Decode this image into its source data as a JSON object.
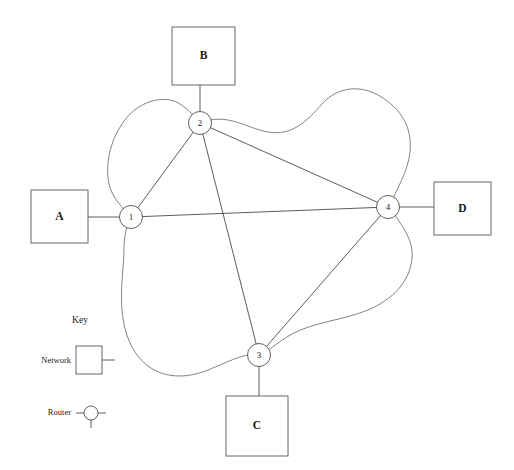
{
  "diagram": {
    "type": "network-topology",
    "title": "",
    "colors": {
      "background": "#ffffff",
      "line": "#4a4a4a",
      "cloud": "#6b6b6b",
      "box_stroke": "#666666",
      "text": "#1a1a1a"
    },
    "networks": [
      {
        "id": "A",
        "label": "A",
        "x": 31,
        "y": 190,
        "w": 57,
        "h": 53,
        "side": "left"
      },
      {
        "id": "B",
        "label": "B",
        "x": 172,
        "y": 27,
        "w": 63,
        "h": 58,
        "side": "top"
      },
      {
        "id": "C",
        "label": "C",
        "x": 226,
        "y": 396,
        "w": 62,
        "h": 60,
        "side": "bottom"
      },
      {
        "id": "D",
        "label": "D",
        "x": 434,
        "y": 182,
        "w": 57,
        "h": 53,
        "side": "right"
      }
    ],
    "routers": [
      {
        "id": "1",
        "label": "1",
        "cx": 131,
        "cy": 217,
        "r": 11.5
      },
      {
        "id": "2",
        "label": "2",
        "cx": 200,
        "cy": 123,
        "r": 11.5
      },
      {
        "id": "3",
        "label": "3",
        "cx": 259,
        "cy": 355,
        "r": 11.5
      },
      {
        "id": "4",
        "label": "4",
        "cx": 388,
        "cy": 207,
        "r": 11.5
      }
    ],
    "links": [
      {
        "from": "1",
        "to": "2"
      },
      {
        "from": "2",
        "to": "4"
      },
      {
        "from": "2",
        "to": "3"
      },
      {
        "from": "1",
        "to": "4"
      },
      {
        "from": "3",
        "to": "4"
      }
    ],
    "attachments": [
      {
        "network": "A",
        "router": "1"
      },
      {
        "network": "B",
        "router": "2"
      },
      {
        "network": "C",
        "router": "3"
      },
      {
        "network": "D",
        "router": "4"
      }
    ]
  },
  "key": {
    "title": "Key",
    "items": [
      {
        "label": "Network",
        "symbol": "network-square-symbol"
      },
      {
        "label": "Router",
        "symbol": "router-circle-symbol"
      }
    ]
  }
}
